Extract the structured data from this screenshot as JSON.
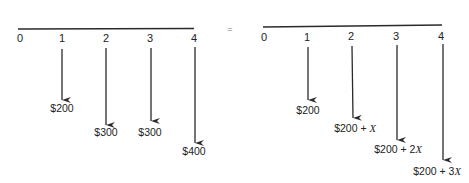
{
  "equals_sign": "=",
  "left_diagram": {
    "periods": [
      "0",
      "1",
      "2",
      "3",
      "4"
    ],
    "cash_flows": [
      {
        "period": "1",
        "label": "$200"
      },
      {
        "period": "2",
        "label": "$300"
      },
      {
        "period": "3",
        "label": "$300"
      },
      {
        "period": "4",
        "label": "$400"
      }
    ]
  },
  "right_diagram": {
    "periods": [
      "0",
      "1",
      "2",
      "3",
      "4"
    ],
    "cash_flows": [
      {
        "period": "1",
        "base": "$200",
        "plus": "",
        "var": ""
      },
      {
        "period": "2",
        "base": "$200",
        "plus": " + ",
        "var": "X"
      },
      {
        "period": "3",
        "base": "$200",
        "plus": " + 2",
        "var": "X"
      },
      {
        "period": "4",
        "base": "$200",
        "plus": " + 3",
        "var": "X"
      }
    ]
  },
  "colors": {
    "line": "#2a2a2a",
    "text": "#222222",
    "background": "#ffffff"
  }
}
